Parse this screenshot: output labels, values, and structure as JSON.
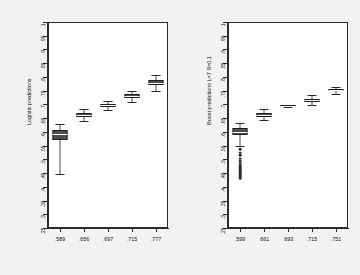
{
  "figure": {
    "background_color": "#f2f2f2",
    "plot_background_color": "#ffffff",
    "frame_color": "#2b2b2b",
    "box_fill_color": "#4f4f4f",
    "median_color": "#ffffff",
    "outlier_color": "#2b2b2b"
  },
  "chart_data": [
    {
      "type": "box",
      "panel": "left",
      "title": "",
      "ylabel": "Logistic predictions",
      "xlabel": "",
      "ylim": [
        0.25,
        1.0
      ],
      "yticks": [
        0.25,
        0.3,
        0.35,
        0.4,
        0.45,
        0.5,
        0.55,
        0.6,
        0.65,
        0.7,
        0.75,
        0.8,
        0.85,
        0.9,
        0.95,
        1.0
      ],
      "ytick_labels": [
        ".25",
        ".3",
        ".35",
        ".4",
        ".45",
        ".5",
        ".55",
        ".6",
        ".65",
        ".7",
        ".75",
        ".8",
        ".85",
        ".9",
        ".95",
        "1"
      ],
      "categories": [
        ".589",
        ".656",
        ".697",
        ".715",
        ".777"
      ],
      "grid": false,
      "legend": "none",
      "boxes": [
        {
          "category": ".589",
          "whisker_low": 0.448,
          "q1": 0.572,
          "median": 0.592,
          "q3": 0.607,
          "whisker_high": 0.628,
          "outliers": []
        },
        {
          "category": ".656",
          "whisker_low": 0.639,
          "q1": 0.654,
          "median": 0.661,
          "q3": 0.668,
          "whisker_high": 0.684,
          "outliers": []
        },
        {
          "category": ".697",
          "whisker_low": 0.679,
          "q1": 0.69,
          "median": 0.696,
          "q3": 0.702,
          "whisker_high": 0.713,
          "outliers": []
        },
        {
          "category": ".715",
          "whisker_low": 0.708,
          "q1": 0.723,
          "median": 0.73,
          "q3": 0.737,
          "whisker_high": 0.75,
          "outliers": []
        },
        {
          "category": ".777",
          "whisker_low": 0.748,
          "q1": 0.769,
          "median": 0.778,
          "q3": 0.788,
          "whisker_high": 0.808,
          "outliers": []
        }
      ]
    },
    {
      "type": "box",
      "panel": "right",
      "title": "",
      "ylabel": "Boost predictions L=7 S=0.1",
      "xlabel": "",
      "ylim": [
        0.25,
        1.0
      ],
      "yticks": [
        0.25,
        0.3,
        0.35,
        0.4,
        0.45,
        0.5,
        0.55,
        0.6,
        0.65,
        0.7,
        0.75,
        0.8,
        0.85,
        0.9,
        0.95,
        1.0
      ],
      "ytick_labels": [
        ".25",
        ".3",
        ".35",
        ".4",
        ".45",
        ".5",
        ".55",
        ".6",
        ".65",
        ".7",
        ".75",
        ".8",
        ".85",
        ".9",
        ".95",
        "1"
      ],
      "categories": [
        ".599",
        ".661",
        ".693",
        ".715",
        ".751"
      ],
      "grid": false,
      "legend": "none",
      "boxes": [
        {
          "category": ".599",
          "whisker_low": 0.548,
          "q1": 0.589,
          "median": 0.601,
          "q3": 0.613,
          "whisker_high": 0.632,
          "outliers": [
            0.536,
            0.524,
            0.515,
            0.503,
            0.495,
            0.487,
            0.479,
            0.471,
            0.464,
            0.457,
            0.45,
            0.444,
            0.438,
            0.431
          ]
        },
        {
          "category": ".661",
          "whisker_low": 0.643,
          "q1": 0.655,
          "median": 0.662,
          "q3": 0.67,
          "whisker_high": 0.684,
          "outliers": []
        },
        {
          "category": ".693",
          "whisker_low": 0.689,
          "q1": 0.692,
          "median": 0.694,
          "q3": 0.696,
          "whisker_high": 0.699,
          "outliers": []
        },
        {
          "category": ".715",
          "whisker_low": 0.699,
          "q1": 0.71,
          "median": 0.715,
          "q3": 0.721,
          "whisker_high": 0.734,
          "outliers": []
        },
        {
          "category": ".751",
          "whisker_low": 0.738,
          "q1": 0.747,
          "median": 0.751,
          "q3": 0.755,
          "whisker_high": 0.763,
          "outliers": []
        }
      ]
    }
  ]
}
